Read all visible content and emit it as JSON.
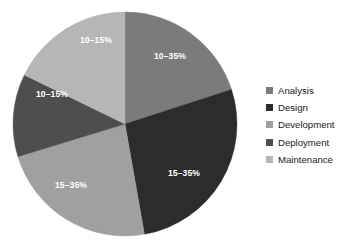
{
  "chart_data": {
    "type": "pie",
    "title": "",
    "subtitle": "",
    "xlabel": "",
    "ylabel": "",
    "grid": false,
    "legend_position": "right",
    "center": {
      "x": 125,
      "y": 124
    },
    "radius": 112,
    "start_angle_deg": 0,
    "direction": "clockwise",
    "categories": [
      "Analysis",
      "Design",
      "Development",
      "Deployment",
      "Maintenance"
    ],
    "values": [
      20,
      27.2,
      23.1,
      12,
      17.7
    ],
    "labels": [
      "10–35%",
      "15–35%",
      "15–35%",
      "10–15%",
      "10–15%"
    ],
    "colors": [
      "#7b7b7b",
      "#2c2c2c",
      "#a0a0a0",
      "#4e4e4e",
      "#b6b6b6"
    ],
    "slices": [
      {
        "name": "Analysis",
        "label": "10–35%",
        "color": "#7b7b7b",
        "start_deg": 0,
        "end_deg": 72,
        "label_x": 170,
        "label_y": 57
      },
      {
        "name": "Design",
        "label": "15–35%",
        "color": "#2c2c2c",
        "start_deg": 72,
        "end_deg": 170,
        "label_x": 184,
        "label_y": 174
      },
      {
        "name": "Development",
        "label": "15–35%",
        "color": "#a0a0a0",
        "start_deg": 170,
        "end_deg": 253,
        "label_x": 71,
        "label_y": 186
      },
      {
        "name": "Deployment",
        "label": "10–15%",
        "color": "#4e4e4e",
        "start_deg": 253,
        "end_deg": 296,
        "label_x": 52,
        "label_y": 95
      },
      {
        "name": "Maintenance",
        "label": "10–15%",
        "color": "#b6b6b6",
        "start_deg": 296,
        "end_deg": 360,
        "label_x": 96,
        "label_y": 41
      }
    ]
  },
  "legend": {
    "items": [
      {
        "label": "Analysis",
        "color": "#7b7b7b"
      },
      {
        "label": "Design",
        "color": "#2c2c2c"
      },
      {
        "label": "Development",
        "color": "#a0a0a0"
      },
      {
        "label": "Deployment",
        "color": "#4e4e4e"
      },
      {
        "label": "Maintenance",
        "color": "#b6b6b6"
      }
    ]
  },
  "background_color": "#ffffff"
}
